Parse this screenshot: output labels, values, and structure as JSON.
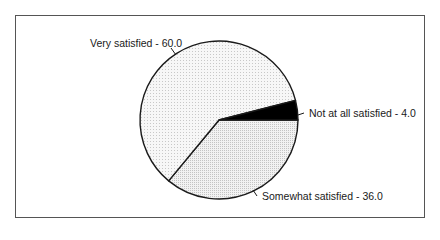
{
  "chart_data": {
    "type": "pie",
    "title": "",
    "categories": [
      "Somewhat satisfied",
      "Very satisfied",
      "Not at all satisfied"
    ],
    "values": [
      36.0,
      60.0,
      4.0
    ],
    "labels": [
      "Somewhat satisfied - 36.0",
      "Very satisfied - 60.0",
      "Not at all satisfied - 4.0"
    ],
    "colors": [
      "#ececec",
      "#f3f3f3",
      "#000000"
    ],
    "start_angle_deg": 0,
    "direction": "clockwise",
    "legend": "none",
    "data_labels": "outside with leader lines"
  },
  "colors": {
    "frame": "#555555",
    "outline": "#1a1a1a"
  }
}
